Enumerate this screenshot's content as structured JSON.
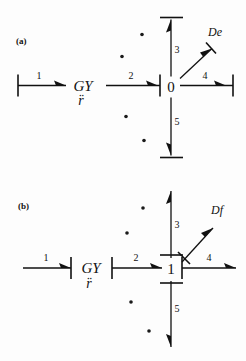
{
  "figure": {
    "type": "bond-graph",
    "panels": [
      {
        "id": "a",
        "label": "(a)",
        "junction": {
          "symbol": "0",
          "kind": "0-junction"
        },
        "element": {
          "label": "GY",
          "modulus": "r̈"
        },
        "source": {
          "label": "De",
          "kind": "effort-detector"
        },
        "bonds": [
          {
            "number": "1",
            "direction": "right",
            "causality": "left-end"
          },
          {
            "number": "2",
            "direction": "right",
            "causality": "right-end"
          },
          {
            "number": "3",
            "direction": "up",
            "causality": "top-end"
          },
          {
            "number": "4",
            "direction": "right",
            "causality": "right-end"
          },
          {
            "number": "5",
            "direction": "down",
            "causality": "bottom-end"
          }
        ]
      },
      {
        "id": "b",
        "label": "(b)",
        "junction": {
          "symbol": "1",
          "kind": "1-junction"
        },
        "element": {
          "label": "GY",
          "modulus": "r̈"
        },
        "source": {
          "label": "Df",
          "kind": "flow-detector"
        },
        "bonds": [
          {
            "number": "1",
            "direction": "right",
            "causality": "right-end"
          },
          {
            "number": "2",
            "direction": "right",
            "causality": "left-end"
          },
          {
            "number": "3",
            "direction": "up",
            "causality": "bottom-end"
          },
          {
            "number": "4",
            "direction": "right",
            "causality": "left-end"
          },
          {
            "number": "5",
            "direction": "down",
            "causality": "top-end"
          }
        ]
      }
    ]
  },
  "colors": {
    "ink": "#111111",
    "paper": "#fdfdfd"
  }
}
